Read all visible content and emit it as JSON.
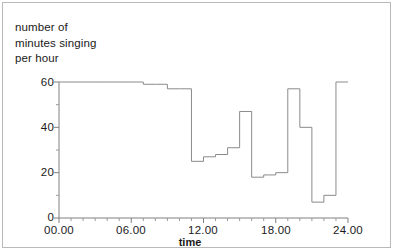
{
  "figure": {
    "y_axis_caption_lines": [
      "number of",
      "minutes singing",
      "per hour"
    ],
    "x_axis_title": "time",
    "y_tick_labels": [
      "60",
      "40",
      "20",
      "0"
    ],
    "x_tick_labels": [
      "00.00",
      "06.00",
      "12.00",
      "18.00",
      "24.00"
    ],
    "line_color": "#8a8a8a",
    "axis_color": "#808080",
    "background_color": "#ffffff",
    "border_color": "#b9b9b9"
  },
  "chart_data": {
    "type": "line",
    "title": "",
    "subtitle": "",
    "xlabel": "time",
    "ylabel": "number of minutes singing per hour",
    "xlim": [
      0,
      24
    ],
    "ylim": [
      0,
      60
    ],
    "grid": false,
    "legend": false,
    "style": "step-post",
    "x_tick_values": [
      0,
      6,
      12,
      18,
      24
    ],
    "x_tick_labels": [
      "00.00",
      "06.00",
      "12.00",
      "18.00",
      "24.00"
    ],
    "x_minor_tick_interval": 1,
    "y_tick_values": [
      0,
      20,
      40,
      60
    ],
    "y_tick_labels": [
      "0",
      "20",
      "40",
      "60"
    ],
    "y_minor_tick_interval": 10,
    "series": [
      {
        "name": "minutes singing per hour",
        "x": [
          0,
          1,
          2,
          3,
          4,
          5,
          6,
          7,
          8,
          9,
          10,
          11,
          12,
          13,
          14,
          15,
          16,
          17,
          18,
          19,
          20,
          21,
          22,
          23,
          24
        ],
        "values": [
          60,
          60,
          60,
          60,
          60,
          60,
          60,
          59,
          59,
          57,
          57,
          25,
          27,
          28,
          31,
          47,
          18,
          19,
          20,
          57,
          40,
          7,
          10,
          60,
          60
        ]
      }
    ],
    "annotations": []
  }
}
